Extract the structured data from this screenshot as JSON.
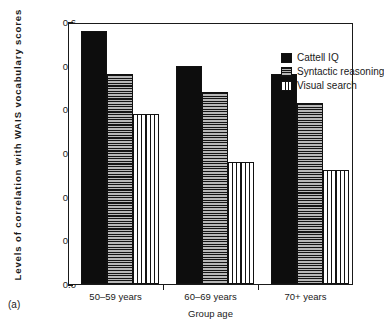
{
  "chart_data": {
    "type": "bar",
    "title": "",
    "panel_label": "(a)",
    "xlabel": "Group age",
    "ylabel": "Levels  of  correlation  with  WAIS  vocabulary  scores",
    "categories": [
      "50–59 years",
      "60–69 years",
      "70+ years"
    ],
    "series": [
      {
        "name": "Cattell IQ",
        "values": [
          0.58,
          0.5,
          0.48
        ],
        "pattern": "solid",
        "color": "#0d0d0d"
      },
      {
        "name": "Syntactic reasoning",
        "values": [
          0.48,
          0.44,
          0.415
        ],
        "pattern": "horizontal-stripe",
        "color": "#b7b7b7"
      },
      {
        "name": "Visual search",
        "values": [
          0.39,
          0.28,
          0.26
        ],
        "pattern": "vertical-stripe",
        "color": "#ffffff"
      }
    ],
    "ylim": [
      0.0,
      0.6
    ],
    "yticks": [
      "0.0",
      "0.1",
      "0.2",
      "0.3",
      "0.4",
      "0.5",
      "0.6"
    ],
    "ytick_values": [
      0.0,
      0.1,
      0.2,
      0.3,
      0.4,
      0.5,
      0.6
    ],
    "grid": false,
    "legend_position": "top-right",
    "frame": true
  },
  "legend": {
    "entries": [
      {
        "label": "Cattell IQ"
      },
      {
        "label": "Syntactic reasoning"
      },
      {
        "label": "Visual search"
      }
    ]
  },
  "axes": {
    "x_title": "Group age",
    "y_title": "Levels  of  correlation  with  WAIS  vocabulary  scores"
  },
  "figure": {
    "panel_label": "(a)"
  }
}
